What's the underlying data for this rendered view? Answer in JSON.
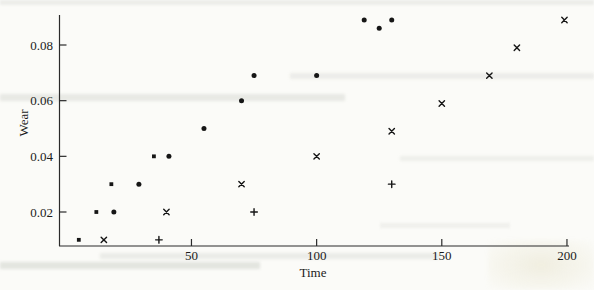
{
  "chart_data": {
    "type": "scatter",
    "title": "",
    "xlabel": "Time",
    "ylabel": "Wear",
    "x_ticks": [
      50,
      100,
      150,
      200
    ],
    "x_tick_labels": [
      "50",
      "100",
      "150",
      "200"
    ],
    "y_ticks": [
      0.02,
      0.04,
      0.06,
      0.08
    ],
    "y_tick_labels": [
      "0.02",
      "0.04",
      "0.06",
      "0.08"
    ],
    "xlim": [
      -3,
      203
    ],
    "ylim": [
      0.008,
      0.092
    ],
    "grid": false,
    "legend": "none",
    "axis_color": "#2b2b2b",
    "marker_color": "#161616",
    "series": [
      {
        "name": "group-filled-square",
        "marker": "filled-square",
        "points": [
          [
            5,
            0.01
          ],
          [
            12,
            0.02
          ],
          [
            18,
            0.03
          ],
          [
            35,
            0.04
          ]
        ]
      },
      {
        "name": "group-filled-circle",
        "marker": "filled-circle",
        "points": [
          [
            19,
            0.02
          ],
          [
            29,
            0.03
          ],
          [
            41,
            0.04
          ],
          [
            55,
            0.05
          ],
          [
            70,
            0.06
          ],
          [
            75,
            0.069
          ],
          [
            100,
            0.069
          ],
          [
            119,
            0.089
          ],
          [
            125,
            0.086
          ],
          [
            130,
            0.089
          ]
        ]
      },
      {
        "name": "group-x-cross",
        "marker": "x-cross",
        "points": [
          [
            15,
            0.01
          ],
          [
            40,
            0.02
          ],
          [
            70,
            0.03
          ],
          [
            100,
            0.04
          ],
          [
            130,
            0.049
          ],
          [
            150,
            0.059
          ],
          [
            169,
            0.069
          ],
          [
            180,
            0.079
          ],
          [
            199,
            0.089
          ]
        ]
      },
      {
        "name": "group-plus",
        "marker": "plus-cross",
        "points": [
          [
            37,
            0.01
          ],
          [
            75,
            0.02
          ],
          [
            130,
            0.03
          ]
        ]
      }
    ]
  }
}
